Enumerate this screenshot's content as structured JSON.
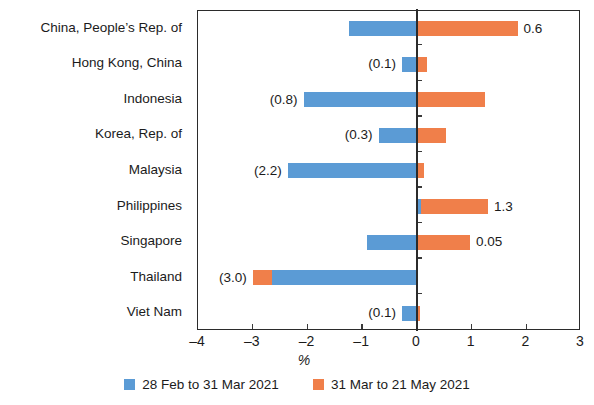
{
  "chart_data": {
    "type": "bar",
    "orientation": "horizontal",
    "stacked": true,
    "title": "",
    "xlabel": "%",
    "ylabel": "",
    "xlim": [
      -4,
      3
    ],
    "xticks": [
      -4,
      -3,
      -2,
      -1,
      0,
      1,
      2,
      3
    ],
    "xticklabels": [
      "–4",
      "–3",
      "–2",
      "–1",
      "0",
      "1",
      "2",
      "3"
    ],
    "grid": false,
    "legend_position": "bottom",
    "categories": [
      "China, People’s Rep. of",
      "Hong Kong, China",
      "Indonesia",
      "Korea, Rep. of",
      "Malaysia",
      "Philippines",
      "Singapore",
      "Thailand",
      "Viet Nam"
    ],
    "series": [
      {
        "name": "28 Feb to 31 Mar 2021",
        "color": "#5b9bd5",
        "values": [
          -1.24,
          -0.27,
          -2.07,
          -0.7,
          -2.36,
          0.08,
          -0.92,
          -2.65,
          -0.27
        ]
      },
      {
        "name": "31 Mar to 21 May 2021",
        "color": "#f07f4a",
        "values": [
          1.84,
          0.18,
          1.25,
          0.53,
          0.13,
          1.22,
          0.97,
          -0.35,
          0.05
        ]
      }
    ],
    "data_labels": [
      {
        "category": "China, People’s Rep. of",
        "text": "0.6",
        "side": "right"
      },
      {
        "category": "Hong Kong, China",
        "text": "(0.1)",
        "side": "left"
      },
      {
        "category": "Indonesia",
        "text": "(0.8)",
        "side": "left"
      },
      {
        "category": "Korea, Rep. of",
        "text": "(0.3)",
        "side": "left"
      },
      {
        "category": "Malaysia",
        "text": "(2.2)",
        "side": "left"
      },
      {
        "category": "Philippines",
        "text": "1.3",
        "side": "right"
      },
      {
        "category": "Singapore",
        "text": "0.05",
        "side": "right"
      },
      {
        "category": "Thailand",
        "text": "(3.0)",
        "side": "left"
      },
      {
        "category": "Viet Nam",
        "text": "(0.1)",
        "side": "left"
      }
    ],
    "legend": [
      {
        "label": "28 Feb to 31 Mar 2021",
        "color": "#5b9bd5"
      },
      {
        "label": "31 Mar to 21 May 2021",
        "color": "#f07f4a"
      }
    ]
  }
}
